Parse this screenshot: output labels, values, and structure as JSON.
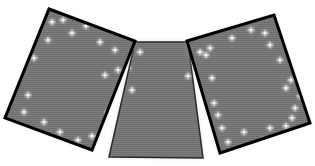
{
  "image": {
    "width": 315,
    "height": 166,
    "background": "#ffffff",
    "description": "Three grey sparkle-textured panels arranged as a fanned tri-fold"
  },
  "style": {
    "panel_fill": "#7c7c7c",
    "panel_stripe": "#6f6f6f",
    "border_color": "#000000",
    "middle_border_color": "#2a2a2a",
    "sparkle_color": "#ffffff"
  },
  "panels": [
    {
      "name": "left-panel",
      "points": "49,9 135,41 92,150 5,118",
      "border_width": 3,
      "sparkles": [
        [
          52,
          22
        ],
        [
          48,
          40
        ],
        [
          34,
          58
        ],
        [
          28,
          95
        ],
        [
          24,
          112
        ],
        [
          44,
          122
        ],
        [
          60,
          132
        ],
        [
          78,
          140
        ],
        [
          92,
          136
        ],
        [
          108,
          112
        ],
        [
          118,
          95
        ],
        [
          105,
          75
        ],
        [
          115,
          50
        ],
        [
          100,
          42
        ],
        [
          72,
          33
        ],
        [
          86,
          26
        ],
        [
          40,
          20
        ],
        [
          63,
          20
        ],
        [
          118,
          70
        ]
      ]
    },
    {
      "name": "middle-panel",
      "points": "135,42 188,42 203,158 109,157",
      "border_width": 1.5,
      "sparkles": [
        [
          140,
          52
        ],
        [
          128,
          68
        ],
        [
          132,
          90
        ],
        [
          118,
          100
        ]
      ]
    },
    {
      "name": "right-panel",
      "points": "187,41 274,15 310,123 220,153",
      "border_width": 3,
      "sparkles": [
        [
          200,
          52
        ],
        [
          206,
          55
        ],
        [
          210,
          48
        ],
        [
          188,
          76
        ],
        [
          212,
          78
        ],
        [
          214,
          103
        ],
        [
          218,
          115
        ],
        [
          222,
          128
        ],
        [
          228,
          142
        ],
        [
          244,
          132
        ],
        [
          263,
          140
        ],
        [
          270,
          128
        ],
        [
          286,
          126
        ],
        [
          292,
          118
        ],
        [
          295,
          108
        ],
        [
          300,
          96
        ],
        [
          286,
          88
        ],
        [
          280,
          60
        ],
        [
          270,
          45
        ],
        [
          265,
          33
        ],
        [
          251,
          30
        ],
        [
          232,
          38
        ],
        [
          291,
          80
        ]
      ]
    }
  ]
}
